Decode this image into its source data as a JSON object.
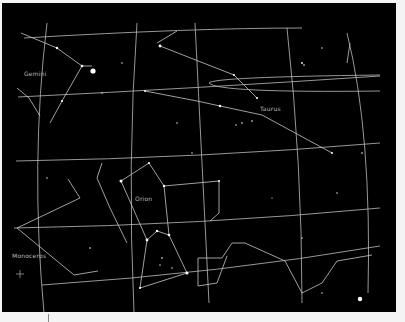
{
  "view": {
    "width": 394,
    "height": 309,
    "background": "#000000",
    "line_color": "#c8c8c8",
    "star_color": "#ffffff"
  },
  "constellation_labels": [
    {
      "name": "Gemini",
      "x": 22,
      "y": 70
    },
    {
      "name": "Taurus",
      "x": 258,
      "y": 105
    },
    {
      "name": "Orion",
      "x": 133,
      "y": 195
    },
    {
      "name": "Monoceros",
      "x": 10,
      "y": 252
    }
  ],
  "grid_lines": [
    {
      "id": "dec-1",
      "d": "M22,35 Q190,25 300,25"
    },
    {
      "id": "dec-2",
      "d": "M16,94 Q200,85 378,73"
    },
    {
      "id": "dec-3",
      "d": "M14,158 Q200,155 378,140"
    },
    {
      "id": "dec-4",
      "d": "M12,225 Q200,222 378,205"
    },
    {
      "id": "dec-5",
      "d": "M40,282 Q220,270 378,243"
    },
    {
      "id": "ra-1",
      "d": "M45,20 Q28,160 42,310"
    },
    {
      "id": "ra-2",
      "d": "M135,20 Q125,160 132,310"
    },
    {
      "id": "ra-3",
      "d": "M193,20 Q200,160 207,300"
    },
    {
      "id": "ra-4",
      "d": "M285,25 Q300,160 300,300"
    },
    {
      "id": "ra-5",
      "d": "M345,30 Q370,130 366,290"
    },
    {
      "id": "ecliptic-arc",
      "d": "M378,72 Q210,74 207,80 Q215,90 378,88"
    }
  ],
  "constellation_lines": [
    {
      "id": "gemini",
      "points": [
        [
          19,
          30
        ],
        [
          55,
          45
        ],
        [
          80,
          63
        ],
        [
          90,
          63
        ]
      ]
    },
    {
      "id": "gemini-2",
      "points": [
        [
          80,
          63
        ],
        [
          60,
          98
        ],
        [
          48,
          120
        ]
      ]
    },
    {
      "id": "gemini-3",
      "points": [
        [
          15,
          85
        ],
        [
          27,
          95
        ],
        [
          38,
          113
        ]
      ]
    },
    {
      "id": "taurus-1",
      "points": [
        [
          158,
          43
        ],
        [
          232,
          72
        ],
        [
          255,
          95
        ]
      ]
    },
    {
      "id": "taurus-2",
      "points": [
        [
          143,
          88
        ],
        [
          195,
          98
        ],
        [
          218,
          103
        ],
        [
          260,
          112
        ],
        [
          330,
          150
        ]
      ]
    },
    {
      "id": "taurus-3",
      "points": [
        [
          155,
          40
        ],
        [
          175,
          28
        ]
      ]
    },
    {
      "id": "orion-1",
      "points": [
        [
          119,
          178
        ],
        [
          147,
          160
        ],
        [
          162,
          183
        ],
        [
          217,
          178
        ]
      ]
    },
    {
      "id": "orion-2",
      "points": [
        [
          119,
          178
        ],
        [
          145,
          237
        ],
        [
          155,
          228
        ],
        [
          167,
          232
        ],
        [
          185,
          270
        ]
      ]
    },
    {
      "id": "orion-3",
      "points": [
        [
          145,
          237
        ],
        [
          138,
          285
        ],
        [
          185,
          270
        ]
      ]
    },
    {
      "id": "orion-4",
      "points": [
        [
          162,
          183
        ],
        [
          167,
          232
        ]
      ]
    },
    {
      "id": "orion-5",
      "points": [
        [
          217,
          178
        ],
        [
          217,
          210
        ],
        [
          208,
          218
        ]
      ]
    },
    {
      "id": "orion-6",
      "points": [
        [
          100,
          160
        ],
        [
          95,
          175
        ],
        [
          108,
          205
        ],
        [
          125,
          240
        ]
      ]
    },
    {
      "id": "monoceros-1",
      "points": [
        [
          66,
          176
        ],
        [
          78,
          195
        ],
        [
          15,
          225
        ],
        [
          72,
          272
        ],
        [
          96,
          268
        ]
      ]
    },
    {
      "id": "eridanus",
      "points": [
        [
          196,
          255
        ],
        [
          196,
          283
        ],
        [
          215,
          280
        ],
        [
          225,
          253
        ]
      ]
    },
    {
      "id": "eridanus-2",
      "points": [
        [
          196,
          255
        ],
        [
          220,
          255
        ],
        [
          230,
          240
        ],
        [
          243,
          240
        ],
        [
          283,
          258
        ],
        [
          300,
          290
        ],
        [
          320,
          280
        ],
        [
          335,
          258
        ],
        [
          370,
          252
        ]
      ]
    },
    {
      "id": "lepus",
      "points": [
        [
          348,
          40
        ],
        [
          345,
          60
        ]
      ]
    }
  ],
  "stars": [
    {
      "x": 91,
      "y": 68,
      "r": 2.6
    },
    {
      "x": 358,
      "y": 296,
      "r": 2.2
    },
    {
      "x": 158,
      "y": 43,
      "r": 1.4
    },
    {
      "x": 55,
      "y": 45,
      "r": 1.2
    },
    {
      "x": 80,
      "y": 63,
      "r": 1.3
    },
    {
      "x": 60,
      "y": 98,
      "r": 1.1
    },
    {
      "x": 119,
      "y": 178,
      "r": 1.5
    },
    {
      "x": 147,
      "y": 160,
      "r": 1.1
    },
    {
      "x": 162,
      "y": 183,
      "r": 1.2
    },
    {
      "x": 145,
      "y": 237,
      "r": 1.4
    },
    {
      "x": 155,
      "y": 228,
      "r": 1.2
    },
    {
      "x": 167,
      "y": 232,
      "r": 1.3
    },
    {
      "x": 185,
      "y": 270,
      "r": 1.5
    },
    {
      "x": 138,
      "y": 285,
      "r": 1.1
    },
    {
      "x": 217,
      "y": 178,
      "r": 1.0
    },
    {
      "x": 232,
      "y": 72,
      "r": 1.0
    },
    {
      "x": 255,
      "y": 95,
      "r": 1.1
    },
    {
      "x": 218,
      "y": 103,
      "r": 1.2
    },
    {
      "x": 330,
      "y": 150,
      "r": 1.0
    },
    {
      "x": 143,
      "y": 88,
      "r": 1.0
    },
    {
      "x": 300,
      "y": 60,
      "r": 0.9
    },
    {
      "x": 302,
      "y": 62,
      "r": 0.8
    },
    {
      "x": 240,
      "y": 120,
      "r": 0.8
    },
    {
      "x": 250,
      "y": 118,
      "r": 0.8
    },
    {
      "x": 234,
      "y": 122,
      "r": 0.7
    },
    {
      "x": 175,
      "y": 120,
      "r": 0.7
    },
    {
      "x": 320,
      "y": 45,
      "r": 0.7
    },
    {
      "x": 360,
      "y": 150,
      "r": 0.8
    },
    {
      "x": 335,
      "y": 190,
      "r": 0.7
    },
    {
      "x": 300,
      "y": 235,
      "r": 0.7
    },
    {
      "x": 88,
      "y": 245,
      "r": 0.8
    },
    {
      "x": 45,
      "y": 175,
      "r": 0.7
    },
    {
      "x": 100,
      "y": 90,
      "r": 0.7
    },
    {
      "x": 120,
      "y": 60,
      "r": 0.7
    },
    {
      "x": 190,
      "y": 150,
      "r": 0.7
    },
    {
      "x": 160,
      "y": 255,
      "r": 0.8
    },
    {
      "x": 158,
      "y": 262,
      "r": 0.7
    },
    {
      "x": 170,
      "y": 265,
      "r": 0.7
    },
    {
      "x": 320,
      "y": 290,
      "r": 0.7
    },
    {
      "x": 270,
      "y": 195,
      "r": 0.6
    }
  ],
  "footer": {
    "tick_x": 48
  }
}
